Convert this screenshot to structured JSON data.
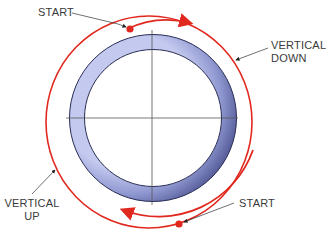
{
  "labels": {
    "start_top": "START",
    "vertical_down_1": "VERTICAL",
    "vertical_down_2": "DOWN",
    "vertical_up_1": "VERTICAL",
    "vertical_up_2": "UP",
    "start_bottom": "START"
  },
  "colors": {
    "red": "#e0281e",
    "ring_outer": "#5a629e",
    "ring_inner": "#b9c0e8",
    "ring_stroke": "#2a2d55",
    "axis": "#555555",
    "leader": "#333333"
  }
}
